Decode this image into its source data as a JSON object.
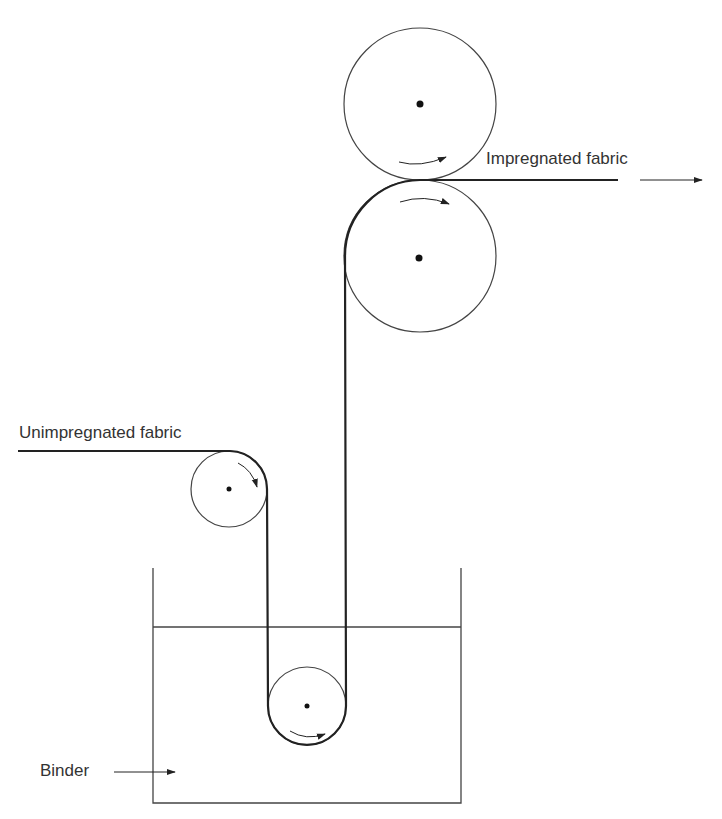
{
  "diagram": {
    "type": "process-schematic",
    "labels": {
      "impregnated": "Impregnated fabric",
      "unimpregnated": "Unimpregnated fabric",
      "binder": "Binder"
    },
    "components": [
      {
        "id": "top-nip-roller",
        "role": "upper squeeze roller",
        "center": [
          420,
          104
        ],
        "radius": 76
      },
      {
        "id": "bottom-nip-roller",
        "role": "lower squeeze roller",
        "center": [
          420,
          256
        ],
        "radius": 76
      },
      {
        "id": "guide-roller",
        "role": "entry guide roller",
        "center": [
          229,
          489
        ],
        "radius": 38
      },
      {
        "id": "dip-roller",
        "role": "immersion roller",
        "center": [
          307,
          706
        ],
        "radius": 39
      },
      {
        "id": "binder-tank",
        "role": "binder bath",
        "left": 153,
        "right": 461,
        "top": 568,
        "bottom": 803,
        "liquid_level": 627
      }
    ],
    "flow": [
      "Unimpregnated fabric",
      "guide roller",
      "binder bath (dip roller)",
      "squeeze rollers",
      "Impregnated fabric"
    ],
    "colors": {
      "line": "#333333",
      "fabric": "#222222",
      "background": "#ffffff"
    }
  }
}
